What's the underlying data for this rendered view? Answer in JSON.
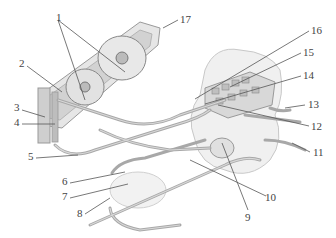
{
  "diagram": {
    "type": "technical-illustration",
    "callouts": [
      {
        "id": "1",
        "text": "1",
        "x": 56,
        "y": 12
      },
      {
        "id": "2",
        "text": "2",
        "x": 19,
        "y": 62
      },
      {
        "id": "3",
        "text": "3",
        "x": 14,
        "y": 106
      },
      {
        "id": "4",
        "text": "4",
        "x": 14,
        "y": 120
      },
      {
        "id": "5",
        "text": "5",
        "x": 28,
        "y": 154
      },
      {
        "id": "6",
        "text": "6",
        "x": 62,
        "y": 179
      },
      {
        "id": "7",
        "text": "7",
        "x": 62,
        "y": 194
      },
      {
        "id": "8",
        "text": "8",
        "x": 77,
        "y": 211
      },
      {
        "id": "9",
        "text": "9",
        "x": 245,
        "y": 214
      },
      {
        "id": "10",
        "text": "10",
        "x": 267,
        "y": 193
      },
      {
        "id": "11",
        "text": "11",
        "x": 313,
        "y": 148
      },
      {
        "id": "12",
        "text": "12",
        "x": 311,
        "y": 122
      },
      {
        "id": "13",
        "text": "13",
        "x": 307,
        "y": 101
      },
      {
        "id": "14",
        "text": "14",
        "x": 303,
        "y": 71
      },
      {
        "id": "15",
        "text": "15",
        "x": 303,
        "y": 48
      },
      {
        "id": "16",
        "text": "16",
        "x": 311,
        "y": 26
      },
      {
        "id": "17",
        "text": "17",
        "x": 180,
        "y": 15
      }
    ]
  }
}
